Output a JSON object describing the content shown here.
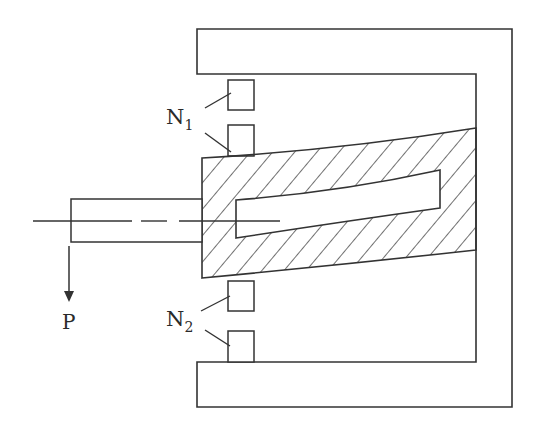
{
  "diagram": {
    "labels": {
      "coil_top": "N",
      "coil_top_sub": "1",
      "coil_bottom": "N",
      "coil_bottom_sub": "2",
      "load": "P"
    },
    "colors": {
      "stroke": "#333333",
      "background": "#ffffff"
    }
  }
}
